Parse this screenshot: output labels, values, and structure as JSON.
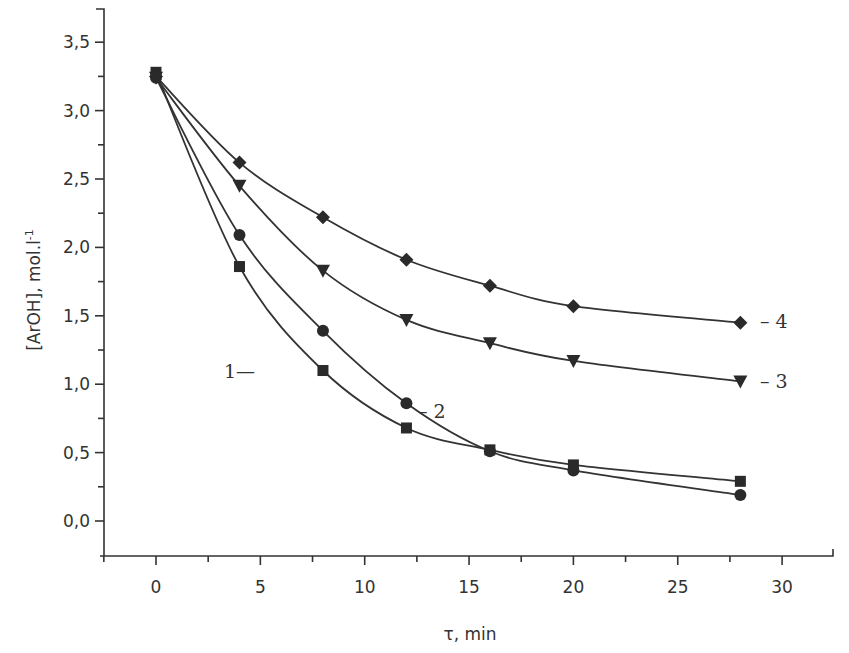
{
  "chart_data": {
    "type": "line",
    "title": "",
    "xlabel": "τ, min",
    "ylabel": "[ArOH], mol.l⁻¹",
    "xlim": [
      -2.5,
      32.5
    ],
    "ylim": [
      -0.25,
      3.75
    ],
    "x_ticks": [
      0,
      5,
      10,
      15,
      20,
      25,
      30
    ],
    "x_tick_labels": [
      "0",
      "5",
      "10",
      "15",
      "20",
      "25",
      "30"
    ],
    "y_ticks": [
      0.0,
      0.5,
      1.0,
      1.5,
      2.0,
      2.5,
      3.0,
      3.5
    ],
    "y_tick_labels": [
      "0,0",
      "0,5",
      "1,0",
      "1,5",
      "2,0",
      "2,5",
      "3,0",
      "3,5"
    ],
    "grid": false,
    "legend": "inline labels next to curves",
    "x": [
      0,
      4,
      8,
      12,
      16,
      20,
      28
    ],
    "series": [
      {
        "name": "1",
        "marker": "square",
        "values": [
          3.28,
          1.86,
          1.1,
          0.68,
          0.52,
          0.41,
          0.29
        ],
        "label": "1—",
        "label_pos": "left of curve near t=6"
      },
      {
        "name": "2",
        "marker": "circle",
        "values": [
          3.24,
          2.09,
          1.39,
          0.86,
          0.51,
          0.37,
          0.19
        ],
        "label": "– 2",
        "label_pos": "right of curve near t=13"
      },
      {
        "name": "3",
        "marker": "triangle-down",
        "values": [
          3.24,
          2.45,
          1.83,
          1.47,
          1.3,
          1.17,
          1.02
        ],
        "label": "– 3",
        "label_pos": "right of last point"
      },
      {
        "name": "4",
        "marker": "diamond",
        "values": [
          3.25,
          2.62,
          2.22,
          1.91,
          1.72,
          1.57,
          1.45
        ],
        "label": "– 4",
        "label_pos": "right of last point"
      }
    ]
  },
  "labels": {
    "xlabel": "τ, min",
    "ylabel": "[ArOH], mol.l",
    "ylabel_sup": "-1",
    "curve1": "1—",
    "curve2": "– 2",
    "curve3": "– 3",
    "curve4": "– 4"
  }
}
